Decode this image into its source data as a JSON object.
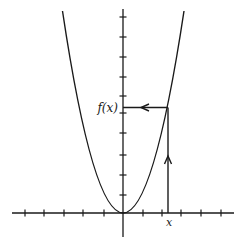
{
  "diagram": {
    "type": "function-graph",
    "curve": "parabola",
    "labels": {
      "x_label": "x",
      "fx_label": "f(x)"
    },
    "colors": {
      "stroke": "#1a1a1a",
      "background": "#ffffff"
    },
    "axes": {
      "origin_px": [
        123,
        213
      ],
      "x_axis_range_px": [
        12,
        234
      ],
      "y_axis_range_px": [
        9,
        237
      ],
      "x_ticks_px": [
        25,
        44,
        64,
        83,
        104,
        143,
        162,
        181,
        201,
        221
      ],
      "y_ticks_px": [
        17,
        37,
        57,
        77,
        96,
        113,
        133,
        155,
        175,
        195
      ]
    },
    "marked_point": {
      "x_px": 168,
      "fx_px": 107.5
    }
  }
}
